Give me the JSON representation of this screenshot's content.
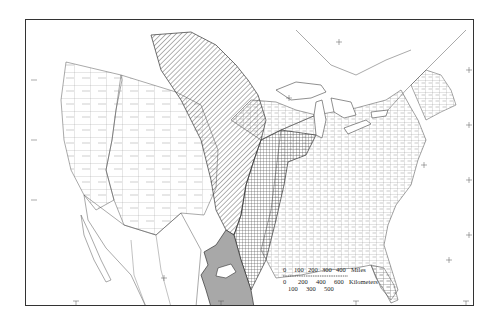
{
  "map": {
    "type": "thematic-region-map",
    "region": "Contiguous United States with southern Canada and northern Mexico",
    "patterns": {
      "diagonal_hatch": "northern Great Plains / prairie region",
      "crosshatch": "eastern prairie transition band",
      "solid_gray": "Texas Gulf coastal plain"
    },
    "colors": {
      "border": "#333333",
      "lines": "#555555",
      "gray_fill": "#a8a8a8",
      "background": "#ffffff"
    }
  },
  "scale_bar": {
    "miles_label": "Miles",
    "miles_ticks": [
      "0",
      "100",
      "200",
      "300",
      "400"
    ],
    "km_label": "Kilometers",
    "km_ticks_top": [
      "0",
      "200",
      "400",
      "600"
    ],
    "km_ticks_bottom": [
      "100",
      "300",
      "500"
    ]
  }
}
